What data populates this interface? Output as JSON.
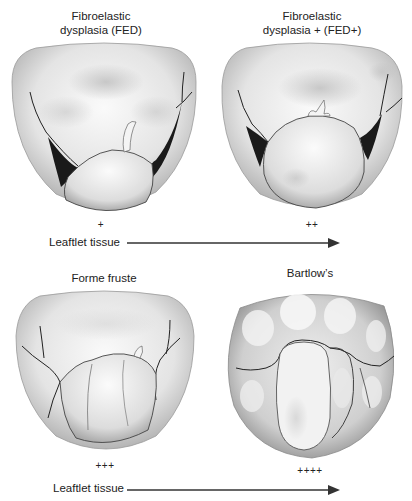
{
  "figure": {
    "panels": [
      {
        "id": "fed",
        "title_line1": "Fibroelastic",
        "title_line2": "dysplasia (FED)",
        "grade": "+"
      },
      {
        "id": "fed_plus",
        "title_line1": "Fibroelastic",
        "title_line2": "dysplasia + (FED+)",
        "grade": "++"
      },
      {
        "id": "forme_fruste",
        "title_line1": "Forme fruste",
        "grade": "+++"
      },
      {
        "id": "barlows",
        "title_line1": "Bartlow’s",
        "grade": "++++"
      }
    ],
    "axis": {
      "top_label": "Leaftlet tissue",
      "bottom_label": "Leaftlet tissue"
    },
    "colors": {
      "background": "#ffffff",
      "text": "#222222",
      "arrow": "#333333",
      "valve_light": "#f2f2f2",
      "valve_mid": "#c8c8c8",
      "valve_dark": "#7a7a7a",
      "shadow": "#1a1a1a"
    }
  }
}
